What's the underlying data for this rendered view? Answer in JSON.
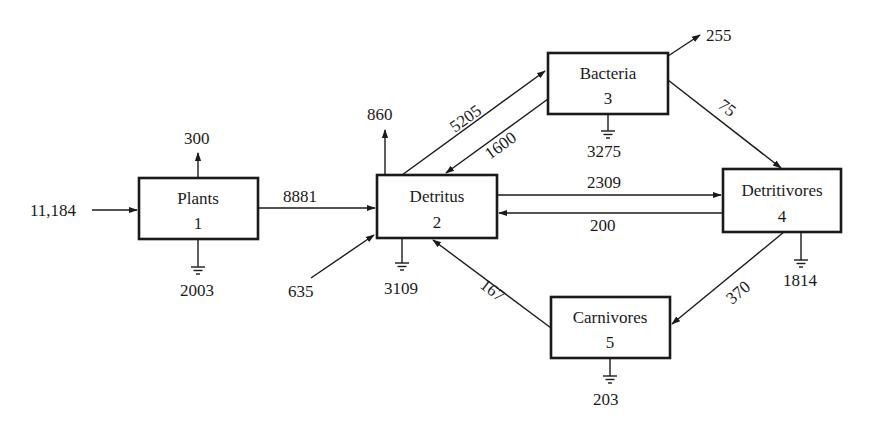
{
  "diagram": {
    "type": "ecosystem energy flow network",
    "compartments": [
      {
        "id": 1,
        "name": "Plants",
        "number": "1"
      },
      {
        "id": 2,
        "name": "Detritus",
        "number": "2"
      },
      {
        "id": 3,
        "name": "Bacteria",
        "number": "3"
      },
      {
        "id": 4,
        "name": "Detritivores",
        "number": "4"
      },
      {
        "id": 5,
        "name": "Carnivores",
        "number": "5"
      }
    ],
    "imports": [
      {
        "to": "Plants",
        "value": "11,184"
      },
      {
        "to": "Detritus",
        "value": "635"
      }
    ],
    "exports": [
      {
        "from": "Plants",
        "value": "300"
      },
      {
        "from": "Detritus",
        "value": "860"
      },
      {
        "from": "Bacteria",
        "value": "255"
      }
    ],
    "respiration": [
      {
        "from": "Plants",
        "value": "2003"
      },
      {
        "from": "Detritus",
        "value": "3109"
      },
      {
        "from": "Bacteria",
        "value": "3275"
      },
      {
        "from": "Detritivores",
        "value": "1814"
      },
      {
        "from": "Carnivores",
        "value": "203"
      }
    ],
    "flows": [
      {
        "from": "Plants",
        "to": "Detritus",
        "value": "8881"
      },
      {
        "from": "Detritus",
        "to": "Bacteria",
        "value": "5205"
      },
      {
        "from": "Bacteria",
        "to": "Detritus",
        "value": "1600"
      },
      {
        "from": "Detritus",
        "to": "Detritivores",
        "value": "2309"
      },
      {
        "from": "Detritivores",
        "to": "Detritus",
        "value": "200"
      },
      {
        "from": "Bacteria",
        "to": "Detritivores",
        "value": "75"
      },
      {
        "from": "Detritivores",
        "to": "Carnivores",
        "value": "370"
      },
      {
        "from": "Carnivores",
        "to": "Detritus",
        "value": "167"
      }
    ]
  }
}
